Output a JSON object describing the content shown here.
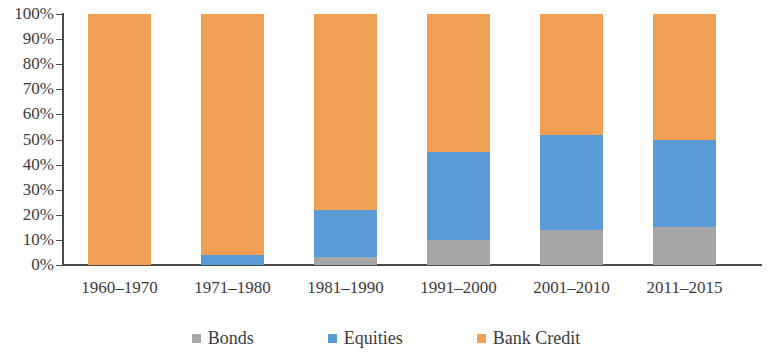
{
  "chart_data": {
    "type": "bar",
    "subtype": "stacked-bar-100-percent",
    "title": "",
    "subtitle": "",
    "xlabel": "",
    "ylabel": "",
    "categories": [
      "1960–1970",
      "1971–1980",
      "1981–1990",
      "1991–2000",
      "2001–2010",
      "2011–2015"
    ],
    "series": [
      {
        "name": "Bonds",
        "color": "#a6a6a6",
        "values": [
          0,
          0,
          3,
          10,
          14,
          15
        ]
      },
      {
        "name": "Equities",
        "color": "#5b9bd5",
        "values": [
          0,
          4,
          19,
          35,
          38,
          35
        ]
      },
      {
        "name": "Bank Credit",
        "color": "#f0a055",
        "values": [
          100,
          96,
          78,
          55,
          48,
          50
        ]
      }
    ],
    "ylim": [
      0,
      100
    ],
    "ytick_labels": [
      "100%",
      "90%",
      "80%",
      "70%",
      "60%",
      "50%",
      "40%",
      "30%",
      "20%",
      "10%",
      "0%"
    ],
    "ytick_values": [
      100,
      90,
      80,
      70,
      60,
      50,
      40,
      30,
      20,
      10,
      0
    ],
    "grid": false,
    "legend_position": "bottom",
    "legend": [
      {
        "label": "Bonds",
        "color": "#a6a6a6"
      },
      {
        "label": "Equities",
        "color": "#5b9bd5"
      },
      {
        "label": "Bank Credit",
        "color": "#f0a055"
      }
    ],
    "axis_color": "#4a4a4a",
    "background": "#ffffff"
  }
}
